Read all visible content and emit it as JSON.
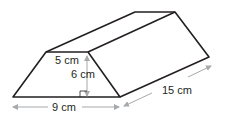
{
  "figure": {
    "type": "trapezoidal prism",
    "labels": {
      "top_width": "5 cm",
      "height": "6 cm",
      "bottom_width": "9 cm",
      "length": "15 cm"
    },
    "colors": {
      "edge": "#231f20",
      "dimension_arrow": "#a7a9ac"
    }
  }
}
